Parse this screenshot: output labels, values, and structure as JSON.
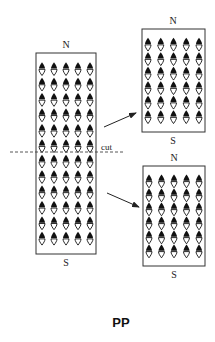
{
  "diagram": {
    "title": "PP",
    "colors": {
      "stroke": "#333333",
      "dipole_fill": "#111111",
      "background": "#ffffff"
    },
    "original_magnet": {
      "north_label": "N",
      "south_label": "S",
      "dipole_rows": 12,
      "dipole_cols": 5,
      "box": {
        "x": 36,
        "y": 53,
        "w": 60,
        "h": 201
      }
    },
    "cut_line": {
      "label": "cut",
      "y": 152,
      "x1": 10,
      "x2": 125,
      "style": "dashed"
    },
    "pieces": [
      {
        "name": "upper-half",
        "north_label": "N",
        "south_label": "S",
        "dipole_rows": 6,
        "dipole_cols": 5,
        "box": {
          "x": 142,
          "y": 29,
          "w": 63,
          "h": 103
        }
      },
      {
        "name": "lower-half",
        "north_label": "N",
        "south_label": "S",
        "dipole_rows": 6,
        "dipole_cols": 5,
        "box": {
          "x": 143,
          "y": 166,
          "w": 62,
          "h": 100
        }
      }
    ],
    "arrows": [
      {
        "name": "arrow-to-upper",
        "x1": 104,
        "y1": 127,
        "x2": 136,
        "y2": 113
      },
      {
        "name": "arrow-to-lower",
        "x1": 107,
        "y1": 193,
        "x2": 139,
        "y2": 207
      }
    ],
    "icons": {
      "dipole": "dipole-arrow-icon"
    }
  }
}
